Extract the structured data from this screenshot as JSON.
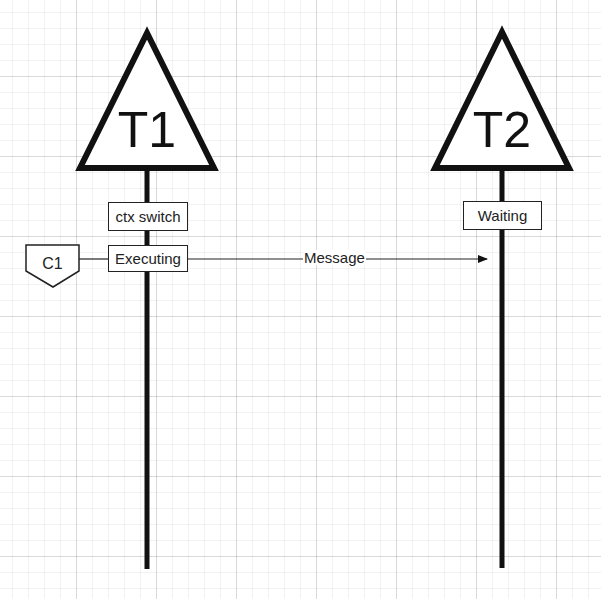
{
  "diagram": {
    "type": "sequence",
    "colors": {
      "stroke": "#111111",
      "grid_minor": "#f2f2f2",
      "grid_major": "#e6e6e6",
      "background": "#ffffff"
    },
    "threads": [
      {
        "id": "T1",
        "label": "T1",
        "states": [
          {
            "label": "ctx switch"
          },
          {
            "label": "Executing"
          }
        ]
      },
      {
        "id": "T2",
        "label": "T2",
        "states": [
          {
            "label": "Waiting"
          }
        ]
      }
    ],
    "caller": {
      "label": "C1"
    },
    "messages": [
      {
        "from": "T1",
        "to": "T2",
        "label": "Message"
      }
    ]
  }
}
